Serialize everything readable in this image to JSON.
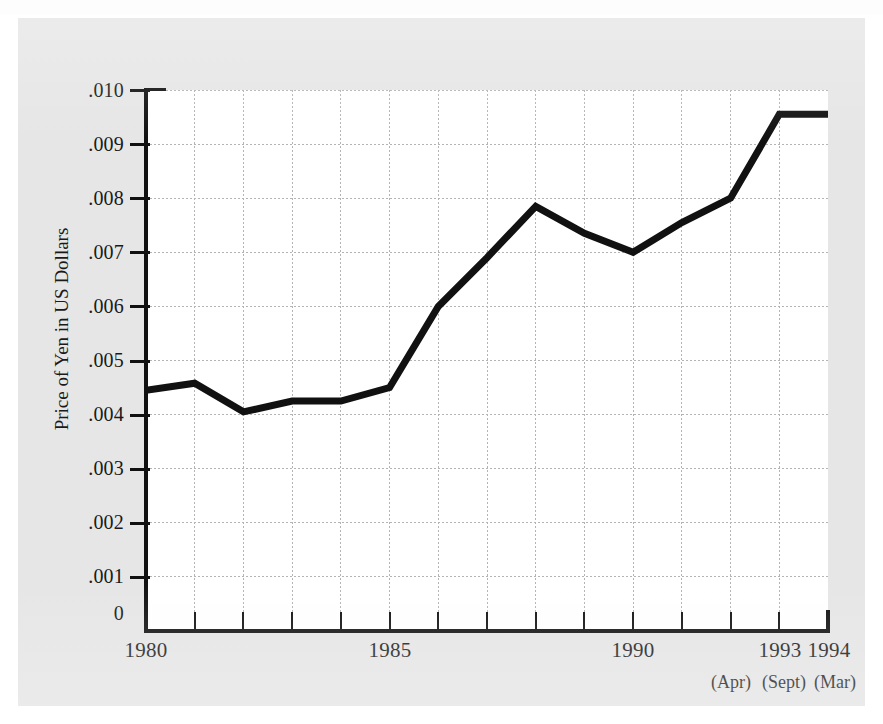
{
  "chart_data": {
    "type": "line",
    "title": "",
    "xlabel": "",
    "ylabel": "Price of Yen in US Dollars",
    "x": [
      1980,
      1981,
      1982,
      1983,
      1984,
      1985,
      1986,
      1987,
      1988,
      1989,
      1990,
      1991,
      1992,
      1993,
      1994
    ],
    "values": [
      0.00445,
      0.00458,
      0.00405,
      0.00425,
      0.00425,
      0.0045,
      0.006,
      0.0069,
      0.00785,
      0.00735,
      0.007,
      0.00755,
      0.008,
      0.00955,
      0.00955
    ],
    "series": [
      {
        "name": "Price of Yen in US Dollars",
        "values": [
          0.00445,
          0.00458,
          0.00405,
          0.00425,
          0.00425,
          0.0045,
          0.006,
          0.0069,
          0.00785,
          0.00735,
          0.007,
          0.00755,
          0.008,
          0.00955,
          0.00955
        ]
      }
    ],
    "xlim": [
      1980,
      1994
    ],
    "ylim": [
      0,
      0.01
    ],
    "grid": true,
    "legend": "none",
    "line_color": "#111111",
    "y_ticks": [
      0.01,
      0.009,
      0.008,
      0.007,
      0.006,
      0.005,
      0.004,
      0.003,
      0.002,
      0.001,
      0
    ],
    "y_tick_labels": [
      ".010",
      ".009",
      ".008",
      ".007",
      ".006",
      ".005",
      ".004",
      ".003",
      ".002",
      ".001",
      "0"
    ],
    "x_tick_values": [
      1980,
      1981,
      1982,
      1983,
      1984,
      1985,
      1986,
      1987,
      1988,
      1989,
      1990,
      1991,
      1992,
      1993,
      1994
    ],
    "x_tick_labels": [
      {
        "value": 1980,
        "label": "1980",
        "sub": ""
      },
      {
        "value": 1985,
        "label": "1985",
        "sub": ""
      },
      {
        "value": 1990,
        "label": "1990",
        "sub": ""
      },
      {
        "value": 1993,
        "label": "1993",
        "sub": "(Sept)"
      },
      {
        "value": 1994,
        "label": "1994",
        "sub": "(Mar)"
      }
    ],
    "annotations": [
      "(Apr)",
      "(Sept)",
      "(Mar)"
    ]
  },
  "axis": {
    "y_title": "Price of Yen in US Dollars",
    "y_labels": {
      "t0": ".010",
      "t1": ".009",
      "t2": ".008",
      "t3": ".007",
      "t4": ".006",
      "t5": ".005",
      "t6": ".004",
      "t7": ".003",
      "t8": ".002",
      "t9": ".001",
      "t10": "0"
    },
    "x_labels": {
      "y1980": "1980",
      "y1985": "1985",
      "y1990": "1990",
      "y1993": "1993",
      "y1994": "1994"
    },
    "x_sub_labels": {
      "apr": "(Apr)",
      "sept": "(Sept)",
      "mar": "(Mar)"
    }
  },
  "colors": {
    "panel_background": "#e6e6e6",
    "plot_background": "#ffffff",
    "axis": "#111111",
    "series_line": "#111111",
    "gridline": "#b4b4b4"
  }
}
